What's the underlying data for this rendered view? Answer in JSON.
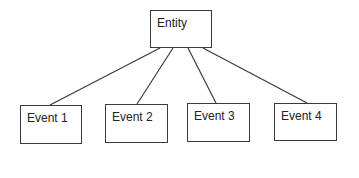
{
  "diagram": {
    "root": {
      "label": "Entity",
      "x": 150,
      "y": 10,
      "w": 62,
      "h": 38
    },
    "children": [
      {
        "label": "Event 1",
        "x": 20,
        "y": 105,
        "w": 62,
        "h": 39,
        "anchor_x": 50
      },
      {
        "label": "Event 2",
        "x": 105,
        "y": 104,
        "w": 63,
        "h": 39,
        "anchor_x": 137
      },
      {
        "label": "Event 3",
        "x": 187,
        "y": 103,
        "w": 63,
        "h": 39,
        "anchor_x": 216
      },
      {
        "label": "Event 4",
        "x": 274,
        "y": 103,
        "w": 63,
        "h": 38,
        "anchor_x": 307
      }
    ],
    "connectors_from": [
      {
        "x": 160,
        "y": 48
      },
      {
        "x": 173,
        "y": 48
      },
      {
        "x": 188,
        "y": 48
      },
      {
        "x": 203,
        "y": 48
      }
    ],
    "stroke_color": "#3a3a3a"
  }
}
